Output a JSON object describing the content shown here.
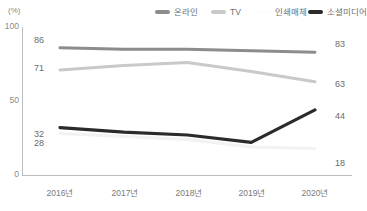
{
  "chart_data": {
    "type": "line",
    "title": "",
    "xlabel": "",
    "ylabel": "(%)",
    "categories": [
      "2016년",
      "2017년",
      "2018년",
      "2019년",
      "2020년"
    ],
    "ylim": [
      0,
      100
    ],
    "yticks": [
      "0",
      "50",
      "100"
    ],
    "grid": false,
    "legend_position": "top",
    "series": [
      {
        "name": "온라인",
        "color": "#8c8c8c",
        "values": [
          86,
          85,
          85,
          84,
          83
        ],
        "start_label": "86",
        "end_label": "83"
      },
      {
        "name": "TV",
        "color": "#c9c9c9",
        "values": [
          71,
          74,
          76,
          70,
          63
        ],
        "start_label": "71",
        "end_label": "63"
      },
      {
        "name": "인쇄매체",
        "color": "#f2f2f2",
        "values": [
          28,
          26,
          24,
          19,
          18
        ],
        "start_label": "28",
        "end_label": "18"
      },
      {
        "name": "소셜미디어",
        "color": "#2b2b2b",
        "values": [
          32,
          29,
          27,
          22,
          44
        ],
        "start_label": "32",
        "end_label": "44"
      }
    ]
  },
  "axis": {
    "unit": "(%)",
    "y_100": "100",
    "y_50": "50",
    "y_0": "0"
  },
  "legend": {
    "items": [
      {
        "label": "온라인",
        "swatch": "#8c8c8c"
      },
      {
        "label": "TV",
        "swatch": "#c9c9c9"
      },
      {
        "label": "인쇄매체",
        "swatch": "#fdfdfd"
      },
      {
        "label": "소셜미디어",
        "swatch": "#2b2b2b"
      }
    ]
  }
}
